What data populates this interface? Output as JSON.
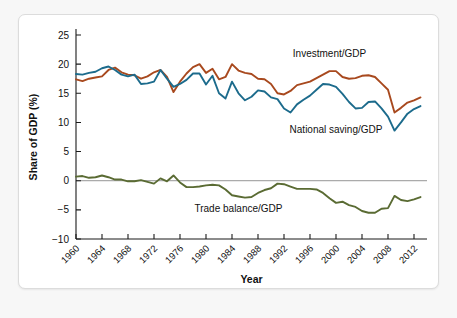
{
  "card": {
    "background": "#ffffff",
    "border_color": "#dcdcdc"
  },
  "chart_data": {
    "type": "line",
    "title": "",
    "xlabel": "Year",
    "ylabel": "Share of GDP (%)",
    "ylim": [
      -10,
      25
    ],
    "xlim": [
      1960,
      2014
    ],
    "yticks": [
      25,
      20,
      15,
      10,
      5,
      0,
      -5,
      -10
    ],
    "ytick_labels": [
      "25",
      "20",
      "15",
      "10",
      "5",
      "0",
      "−5",
      "−10"
    ],
    "xticks": [
      1960,
      1964,
      1968,
      1972,
      1976,
      1980,
      1984,
      1988,
      1992,
      1996,
      2000,
      2004,
      2008,
      2012
    ],
    "xtick_labels": [
      "1960",
      "1964",
      "1968",
      "1972",
      "1976",
      "1980",
      "1984",
      "1988",
      "1992",
      "1996",
      "2000",
      "2004",
      "2008",
      "2012"
    ],
    "grid": false,
    "legend_position": "inline-annotations",
    "zero_line": true,
    "x": [
      1960,
      1961,
      1962,
      1963,
      1964,
      1965,
      1966,
      1967,
      1968,
      1969,
      1970,
      1971,
      1972,
      1973,
      1974,
      1975,
      1976,
      1977,
      1978,
      1979,
      1980,
      1981,
      1982,
      1983,
      1984,
      1985,
      1986,
      1987,
      1988,
      1989,
      1990,
      1991,
      1992,
      1993,
      1994,
      1995,
      1996,
      1997,
      1998,
      1999,
      2000,
      2001,
      2002,
      2003,
      2004,
      2005,
      2006,
      2007,
      2008,
      2009,
      2010,
      2011,
      2012,
      2013
    ],
    "series": [
      {
        "name": "Investment/GDP",
        "color": "#A8491E",
        "label_x": 1999,
        "label_y": 21.3,
        "values": [
          17.4,
          17.1,
          17.5,
          17.7,
          17.9,
          19.0,
          19.4,
          18.6,
          18.2,
          18.1,
          17.5,
          17.9,
          18.6,
          19.0,
          17.8,
          15.2,
          17.0,
          18.4,
          19.5,
          20.0,
          18.5,
          19.2,
          17.4,
          17.8,
          20.0,
          18.9,
          18.5,
          18.3,
          17.5,
          17.4,
          16.6,
          15.0,
          14.8,
          15.4,
          16.4,
          16.7,
          17.0,
          17.6,
          18.2,
          18.8,
          18.8,
          17.8,
          17.5,
          17.6,
          18.0,
          18.1,
          17.8,
          16.7,
          15.6,
          11.7,
          12.5,
          13.4,
          13.8,
          14.3
        ],
        "label": "Investment/GDP"
      },
      {
        "name": "National saving/GDP",
        "color": "#1C6B8C",
        "label_x": 2000,
        "label_y": 8.2,
        "values": [
          18.3,
          18.2,
          18.5,
          18.7,
          19.3,
          19.6,
          19.0,
          18.2,
          17.9,
          18.2,
          16.6,
          16.7,
          17.0,
          19.0,
          17.5,
          16.1,
          16.6,
          17.3,
          18.4,
          18.4,
          16.5,
          18.0,
          15.0,
          14.1,
          17.0,
          15.0,
          13.8,
          14.4,
          15.5,
          15.3,
          14.3,
          14.0,
          12.4,
          11.7,
          13.1,
          13.9,
          14.6,
          15.6,
          16.6,
          16.5,
          16.1,
          14.9,
          13.5,
          12.4,
          12.5,
          13.5,
          13.6,
          12.4,
          11.0,
          8.6,
          10.0,
          11.5,
          12.3,
          12.8
        ],
        "label": "National saving/GDP"
      },
      {
        "name": "Trade balance/GDP",
        "color": "#5A6B33",
        "label_x": 1985,
        "label_y": -5.3,
        "values": [
          0.7,
          0.8,
          0.5,
          0.6,
          0.9,
          0.6,
          0.2,
          0.2,
          -0.1,
          -0.1,
          0.1,
          -0.2,
          -0.5,
          0.4,
          -0.1,
          0.9,
          -0.3,
          -1.1,
          -1.1,
          -1.0,
          -0.8,
          -0.7,
          -0.8,
          -1.5,
          -2.5,
          -2.7,
          -2.9,
          -2.8,
          -2.1,
          -1.6,
          -1.3,
          -0.5,
          -0.6,
          -1.0,
          -1.4,
          -1.4,
          -1.4,
          -1.5,
          -2.1,
          -3.0,
          -3.8,
          -3.6,
          -4.2,
          -4.5,
          -5.2,
          -5.5,
          -5.5,
          -4.8,
          -4.7,
          -2.6,
          -3.3,
          -3.5,
          -3.2,
          -2.8
        ],
        "label": "Trade balance/GDP"
      }
    ]
  }
}
